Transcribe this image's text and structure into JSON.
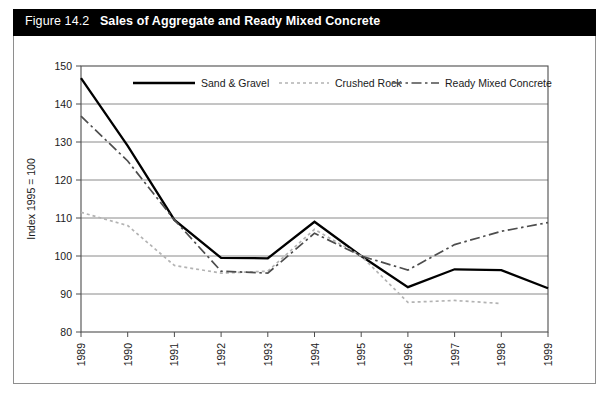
{
  "figure": {
    "number": "Figure 14.2",
    "name": "Sales of Aggregate and Ready Mixed Concrete",
    "title_bar_color": "#000000",
    "title_text_color": "#ffffff"
  },
  "chart_data": {
    "type": "line",
    "title": "Sales of Aggregate and Ready Mixed Concrete",
    "subtitle": "",
    "xlabel": "",
    "ylabel": "Index 1995 = 100",
    "x": [
      "1989",
      "1990",
      "1991",
      "1992",
      "1993",
      "1994",
      "1995",
      "1996",
      "1997",
      "1998",
      "1999"
    ],
    "categories": [
      "1989",
      "1990",
      "1991",
      "1992",
      "1993",
      "1994",
      "1995",
      "1996",
      "1997",
      "1998",
      "1999"
    ],
    "ylim": [
      80,
      150
    ],
    "yticks": [
      80,
      90,
      100,
      110,
      120,
      130,
      140,
      150
    ],
    "ytick_labels": [
      "80",
      "90",
      "100",
      "110",
      "120",
      "130",
      "140",
      "150"
    ],
    "grid": true,
    "grid_axis": "y",
    "legend_position": "top-inside",
    "series": [
      {
        "name": "Sand & Gravel",
        "style": "solid",
        "color": "#000000",
        "values": [
          146.8,
          129.0,
          109.5,
          99.5,
          99.4,
          109.0,
          100.0,
          91.8,
          96.5,
          96.3,
          91.5
        ]
      },
      {
        "name": "Crushed Rock",
        "style": "dotted",
        "color": "#b3b3b3",
        "values": [
          111.5,
          108.0,
          97.5,
          95.5,
          96.0,
          107.0,
          100.0,
          87.8,
          88.3,
          87.5,
          null
        ]
      },
      {
        "name": "Ready Mixed Concrete",
        "style": "dash-dot",
        "color": "#4d4d4d",
        "values": [
          136.8,
          125.0,
          109.5,
          96.0,
          95.5,
          106.0,
          100.0,
          96.3,
          103.0,
          106.5,
          108.8
        ]
      }
    ]
  },
  "legend": {
    "items": [
      {
        "label": "Sand & Gravel"
      },
      {
        "label": "Crushed Rock"
      },
      {
        "label": "Ready Mixed Concrete"
      }
    ]
  }
}
